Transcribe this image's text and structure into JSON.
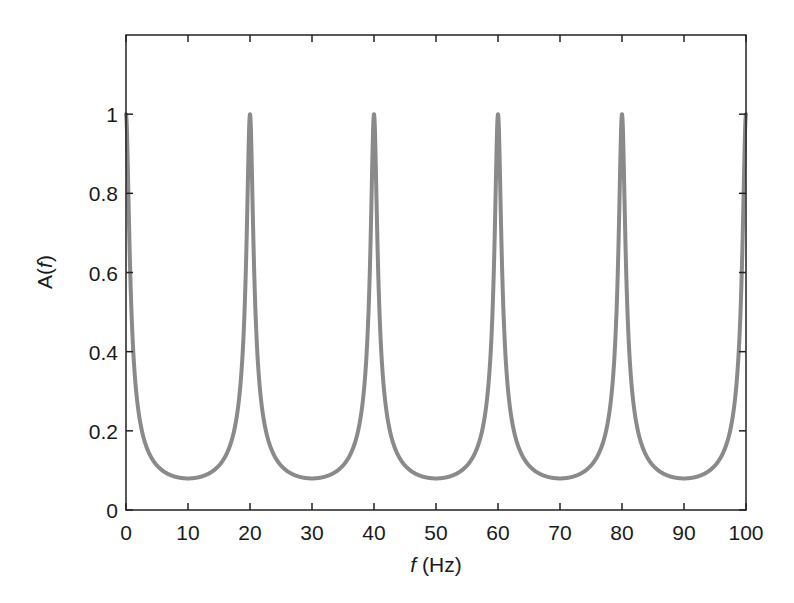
{
  "chart_data": {
    "type": "line",
    "title": "",
    "xlabel": "f (Hz)",
    "xlabel_italic_part": "f",
    "xlabel_rest": " (Hz)",
    "ylabel": "A(f)",
    "ylabel_prefix": "A(",
    "ylabel_italic_part": "f",
    "ylabel_suffix": ")",
    "xlim": [
      0,
      100
    ],
    "ylim": [
      0,
      1.2
    ],
    "xticks": [
      0,
      10,
      20,
      30,
      40,
      50,
      60,
      70,
      80,
      90,
      100
    ],
    "xtick_labels": [
      "0",
      "10",
      "20",
      "30",
      "40",
      "50",
      "60",
      "70",
      "80",
      "90",
      "100"
    ],
    "yticks": [
      0,
      0.2,
      0.4,
      0.6,
      0.8,
      1
    ],
    "ytick_labels": [
      "0",
      "0.2",
      "0.4",
      "0.6",
      "0.8",
      "1"
    ],
    "grid": false,
    "legend": null,
    "line_color": "#8a8a8a",
    "series": [
      {
        "name": "A(f)",
        "description": "Periodic resonance response with period 20 Hz; peaks of 1 at multiples of 20 Hz, minima ~0.08 at odd multiples of 10 Hz",
        "x": [
          0,
          1,
          2,
          3,
          4,
          5,
          6,
          7,
          8,
          9,
          10,
          11,
          12,
          13,
          14,
          15,
          16,
          17,
          18,
          19,
          20,
          21,
          22,
          23,
          24,
          25,
          26,
          27,
          28,
          29,
          30,
          31,
          32,
          33,
          34,
          35,
          36,
          37,
          38,
          39,
          40,
          41,
          42,
          43,
          44,
          45,
          46,
          47,
          48,
          49,
          50,
          51,
          52,
          53,
          54,
          55,
          56,
          57,
          58,
          59,
          60,
          61,
          62,
          63,
          64,
          65,
          66,
          67,
          68,
          69,
          70,
          71,
          72,
          73,
          74,
          75,
          76,
          77,
          78,
          79,
          80,
          81,
          82,
          83,
          84,
          85,
          86,
          87,
          88,
          89,
          90,
          91,
          92,
          93,
          94,
          95,
          96,
          97,
          98,
          99,
          100
        ],
        "values": [
          1.0,
          0.455,
          0.251,
          0.174,
          0.135,
          0.112,
          0.098,
          0.089,
          0.084,
          0.081,
          0.08,
          0.081,
          0.084,
          0.089,
          0.098,
          0.112,
          0.135,
          0.174,
          0.251,
          0.455,
          1.0,
          0.455,
          0.251,
          0.174,
          0.135,
          0.112,
          0.098,
          0.089,
          0.084,
          0.081,
          0.08,
          0.081,
          0.084,
          0.089,
          0.098,
          0.112,
          0.135,
          0.174,
          0.251,
          0.455,
          1.0,
          0.455,
          0.251,
          0.174,
          0.135,
          0.112,
          0.098,
          0.089,
          0.084,
          0.081,
          0.08,
          0.081,
          0.084,
          0.089,
          0.098,
          0.112,
          0.135,
          0.174,
          0.251,
          0.455,
          1.0,
          0.455,
          0.251,
          0.174,
          0.135,
          0.112,
          0.098,
          0.089,
          0.084,
          0.081,
          0.08,
          0.081,
          0.084,
          0.089,
          0.098,
          0.112,
          0.135,
          0.174,
          0.251,
          0.455,
          1.0,
          0.455,
          0.251,
          0.174,
          0.135,
          0.112,
          0.098,
          0.089,
          0.084,
          0.081,
          0.08,
          0.081,
          0.084,
          0.089,
          0.098,
          0.112,
          0.135,
          0.174,
          0.251,
          0.455,
          1.0
        ],
        "peaks": [
          {
            "x": 0,
            "y": 1
          },
          {
            "x": 20,
            "y": 1
          },
          {
            "x": 40,
            "y": 1
          },
          {
            "x": 60,
            "y": 1
          },
          {
            "x": 80,
            "y": 1
          },
          {
            "x": 100,
            "y": 1
          }
        ],
        "minima": [
          {
            "x": 10,
            "y": 0.08
          },
          {
            "x": 30,
            "y": 0.08
          },
          {
            "x": 50,
            "y": 0.08
          },
          {
            "x": 70,
            "y": 0.08
          },
          {
            "x": 90,
            "y": 0.08
          }
        ],
        "model": {
          "period_hz": 20,
          "min_value": 0.08
        }
      }
    ]
  }
}
